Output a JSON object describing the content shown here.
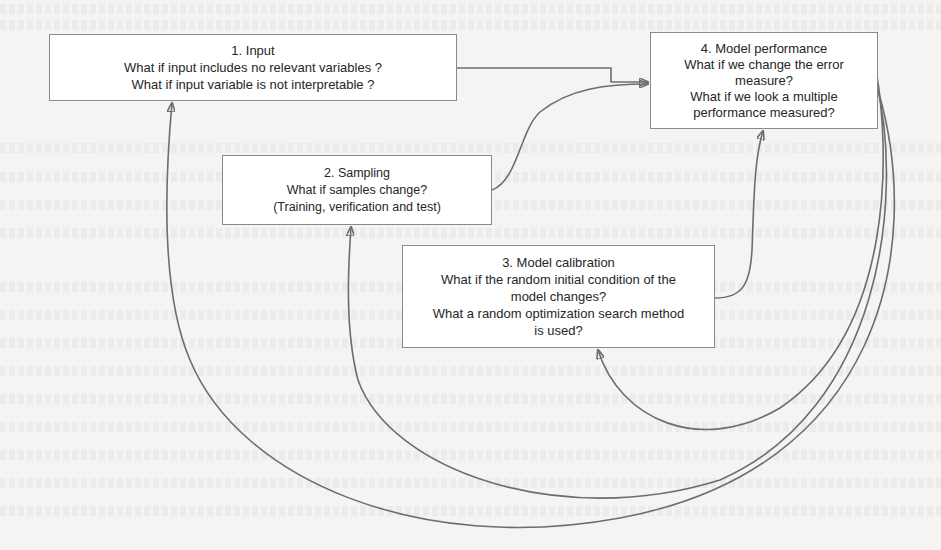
{
  "diagram": {
    "type": "flow-diagram",
    "nodes": [
      {
        "id": "input",
        "title": "1. Input",
        "lines": [
          "What if input includes no relevant variables ?",
          "What if input variable is not interpretable ?"
        ]
      },
      {
        "id": "sampling",
        "title": "2. Sampling",
        "lines": [
          "What if samples change?",
          "(Training, verification and test)"
        ]
      },
      {
        "id": "calibration",
        "title": "3. Model calibration",
        "lines": [
          "What if the random initial condition of the",
          "model changes?",
          "What a random optimization search method",
          "is used?"
        ]
      },
      {
        "id": "performance",
        "title": "4. Model performance",
        "lines": [
          "What if we change the error",
          "measure?",
          "What if we look a multiple",
          "performance measured?"
        ]
      }
    ],
    "edges": [
      {
        "from": "input",
        "to": "performance",
        "style": "elbow-arrow"
      },
      {
        "from": "sampling",
        "to": "performance",
        "style": "curved-arrow"
      },
      {
        "from": "calibration",
        "to": "performance",
        "style": "curved-arrow"
      },
      {
        "from": "performance",
        "to": "input",
        "style": "feedback-loop-arrow"
      },
      {
        "from": "performance",
        "to": "sampling",
        "style": "feedback-loop-arrow"
      },
      {
        "from": "performance",
        "to": "calibration",
        "style": "feedback-loop-arrow"
      }
    ],
    "colors": {
      "box_border": "#8a8a8a",
      "box_fill": "#ffffff",
      "line": "#6d6d6d",
      "text": "#262626",
      "background": "#f4f4f2"
    }
  }
}
